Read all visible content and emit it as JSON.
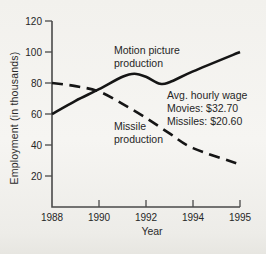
{
  "figure": {
    "background": "#f3f2ee",
    "axis_color": "#4a4a4a",
    "line_color": "#151515",
    "text_color": "#262626"
  },
  "chart_data": {
    "type": "line",
    "title": "",
    "xlabel": "Year",
    "ylabel": "Employment (in thousands)",
    "x_tick_labels": [
      "1988",
      "1990",
      "1992",
      "1994",
      "1995"
    ],
    "x_tick_values": [
      1988,
      1990,
      1992,
      1994,
      1995
    ],
    "y_ticks": [
      20,
      40,
      60,
      80,
      100,
      120
    ],
    "ylim": [
      0,
      120
    ],
    "grid": false,
    "legend_position": "inline-labels",
    "series": [
      {
        "name": "Motion picture production",
        "label_lines": [
          "Motion picture",
          "production"
        ],
        "line_style": "solid",
        "color": "#151515",
        "x": [
          1988,
          1989,
          1990,
          1991,
          1991.5,
          1992,
          1992.6,
          1993,
          1994,
          1995
        ],
        "values": [
          60,
          68.5,
          76,
          84,
          86,
          84,
          79.5,
          80.5,
          87.5,
          100
        ]
      },
      {
        "name": "Missile production",
        "label_lines": [
          "Missile",
          "production"
        ],
        "line_style": "dashed",
        "color": "#151515",
        "x": [
          1988,
          1989,
          1990,
          1991,
          1992,
          1993,
          1994,
          1995
        ],
        "values": [
          80,
          78,
          74.5,
          66.5,
          57.5,
          47.5,
          38,
          27.5
        ]
      }
    ],
    "annotations": [
      "Avg. hourly wage",
      "Movies: $32.70",
      "Missiles: $20.60"
    ]
  }
}
